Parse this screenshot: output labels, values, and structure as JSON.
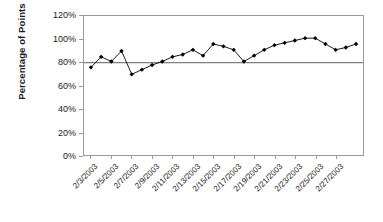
{
  "chart_data": {
    "type": "line",
    "title": "",
    "xlabel": "",
    "ylabel": "Percentage of Points",
    "ylim": [
      0,
      120
    ],
    "ytick_labels": [
      "0%",
      "20%",
      "40%",
      "60%",
      "80%",
      "100%",
      "120%"
    ],
    "ytick_values": [
      0,
      20,
      40,
      60,
      80,
      100,
      120
    ],
    "grid": false,
    "legend": "none",
    "marker": "filled-diamond",
    "line_color": "#000000",
    "marker_color": "#000000",
    "reference_line": {
      "value": 80,
      "label": "",
      "color": "#7f7f7f"
    },
    "xtick_labels": [
      "2/3/2003",
      "2/5/2003",
      "2/7/2003",
      "2/9/2003",
      "2/11/2003",
      "2/13/2003",
      "2/15/2003",
      "2/17/2003",
      "2/19/2003",
      "2/21/2003",
      "2/23/2003",
      "2/25/2003",
      "2/27/2003"
    ],
    "categories": [
      "2/3/2003",
      "2/4/2003",
      "2/5/2003",
      "2/6/2003",
      "2/7/2003",
      "2/8/2003",
      "2/9/2003",
      "2/10/2003",
      "2/11/2003",
      "2/12/2003",
      "2/13/2003",
      "2/14/2003",
      "2/15/2003",
      "2/16/2003",
      "2/17/2003",
      "2/18/2003",
      "2/19/2003",
      "2/20/2003",
      "2/21/2003",
      "2/22/2003",
      "2/23/2003",
      "2/24/2003",
      "2/25/2003",
      "2/26/2003",
      "2/27/2003",
      "2/28/2003",
      "3/1/2003"
    ],
    "values": [
      76,
      85,
      81,
      90,
      70,
      74,
      78,
      81,
      85,
      87,
      91,
      86,
      96,
      94,
      91,
      81,
      86,
      91,
      95,
      97,
      99,
      101,
      101,
      96,
      91,
      93,
      96
    ]
  }
}
